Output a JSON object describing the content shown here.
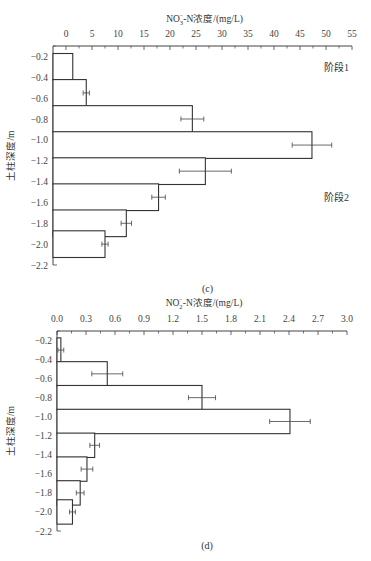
{
  "chart_data": [
    {
      "type": "bar",
      "orientation": "horizontal",
      "panel_label": "(c)",
      "xlabel": "NO3−-N浓度/(mg/L)",
      "xlabel_main": "NO",
      "xlabel_sub": "3",
      "xlabel_sup": "−",
      "xlabel_rest": "-N浓度/(mg/L)",
      "ylabel": "土柱深度/m",
      "xlim": [
        -2.5,
        55
      ],
      "x_ticks": [
        0,
        5,
        10,
        15,
        20,
        25,
        30,
        35,
        40,
        45,
        50,
        55
      ],
      "x_tick_labels": [
        "0",
        "5",
        "10",
        "15",
        "20",
        "25",
        "30",
        "35",
        "40",
        "45",
        "50",
        "55"
      ],
      "ylim": [
        -0.1,
        -2.2
      ],
      "y_ticks": [
        -0.2,
        -0.4,
        -0.6,
        -0.8,
        -1.0,
        -1.2,
        -1.4,
        -1.6,
        -1.8,
        -2.0,
        -2.2
      ],
      "y_tick_labels": [
        "−0.2",
        "−0.4",
        "−0.6",
        "−0.8",
        "−1.0",
        "−1.2",
        "−1.4",
        "−1.6",
        "−1.8",
        "−2.0",
        "−2.2"
      ],
      "categories": [
        -0.3,
        -0.55,
        -0.8,
        -1.05,
        -1.3,
        -1.55,
        -1.8,
        -2.0
      ],
      "values": [
        1.3,
        3.9,
        24.3,
        47.3,
        26.8,
        17.8,
        11.6,
        7.5
      ],
      "errors": [
        0,
        0.6,
        2.2,
        3.8,
        5.0,
        1.3,
        1.0,
        0.6
      ],
      "annotations": [
        {
          "text": "阶段1",
          "x": 52,
          "y": -0.3
        },
        {
          "text": "阶段2",
          "x": 52,
          "y": -1.55
        }
      ]
    },
    {
      "type": "bar",
      "orientation": "horizontal",
      "panel_label": "(d)",
      "xlabel": "NO2−-N浓度/(mg/L)",
      "xlabel_main": "NO",
      "xlabel_sub": "2",
      "xlabel_sup": "−",
      "xlabel_rest": "-N浓度/(mg/L)",
      "ylabel": "土柱深度/m",
      "xlim": [
        0,
        3.0
      ],
      "x_ticks": [
        0,
        0.3,
        0.6,
        0.9,
        1.2,
        1.5,
        1.8,
        2.1,
        2.4,
        2.7,
        3.0
      ],
      "x_tick_labels": [
        "0.0",
        "0.3",
        "0.6",
        "0.9",
        "1.2",
        "1.5",
        "1.8",
        "2.1",
        "2.4",
        "2.7",
        "3.0"
      ],
      "ylim": [
        -0.1,
        -2.2
      ],
      "y_ticks": [
        -0.2,
        -0.4,
        -0.6,
        -0.8,
        -1.0,
        -1.2,
        -1.4,
        -1.6,
        -1.8,
        -2.0,
        -2.2
      ],
      "y_tick_labels": [
        "−0.2",
        "−0.4",
        "−0.6",
        "−0.8",
        "−1.0",
        "−1.2",
        "−1.4",
        "−1.6",
        "−1.8",
        "−2.0",
        "−2.2"
      ],
      "categories": [
        -0.3,
        -0.55,
        -0.8,
        -1.05,
        -1.3,
        -1.55,
        -1.8,
        -2.0
      ],
      "values": [
        0.04,
        0.52,
        1.5,
        2.41,
        0.39,
        0.31,
        0.24,
        0.16
      ],
      "errors": [
        0.03,
        0.16,
        0.14,
        0.21,
        0.05,
        0.06,
        0.04,
        0.03
      ],
      "annotations": []
    }
  ]
}
